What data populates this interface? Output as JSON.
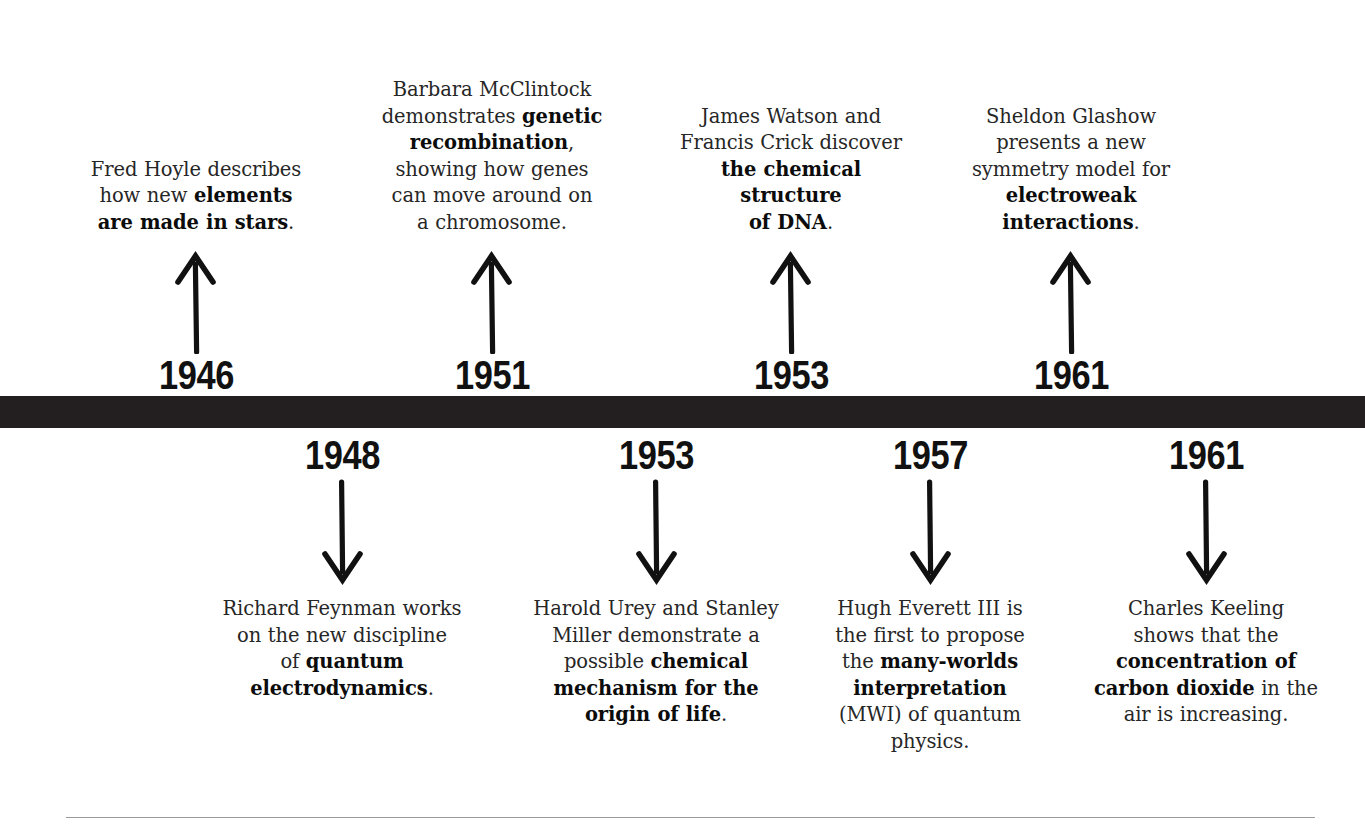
{
  "theme": {
    "background": "#ffffff",
    "bar_color": "#231f20",
    "text_color": "#262626",
    "emphasis_color": "#0c0c0c",
    "rule_color": "#9a9a9a"
  },
  "timeline": {
    "axis_label": "timeline-bar",
    "events_above": [
      {
        "year": "1946",
        "arrow": "arrow-up",
        "caption_html": "Fred Hoyle describes<br>how new <b>elements<br>are made in stars</b>.",
        "caption_text": "Fred Hoyle describes how new elements are made in stars.",
        "emphasis": "elements are made in stars"
      },
      {
        "year": "1951",
        "arrow": "arrow-up",
        "caption_html": "Barbara McClintock<br>demonstrates <b>genetic<br>recombination</b>,<br>showing how genes<br>can move around on<br>a chromosome.",
        "caption_text": "Barbara McClintock demonstrates genetic recombination, showing how genes can move around on a chromosome.",
        "emphasis": "genetic recombination"
      },
      {
        "year": "1953",
        "arrow": "arrow-up",
        "caption_html": "James Watson and<br>Francis Crick discover<br><b>the chemical<br>structure<br>of DNA</b>.",
        "caption_text": "James Watson and Francis Crick discover the chemical structure of DNA.",
        "emphasis": "the chemical structure of DNA"
      },
      {
        "year": "1961",
        "arrow": "arrow-up",
        "caption_html": "Sheldon Glashow<br>presents a new<br>symmetry model for<br><b>electroweak<br>interactions</b>.",
        "caption_text": "Sheldon Glashow presents a new symmetry model for electroweak interactions.",
        "emphasis": "electroweak interactions"
      }
    ],
    "events_below": [
      {
        "year": "1948",
        "arrow": "arrow-down",
        "caption_html": "Richard Feynman works<br>on the new discipline<br>of <b>quantum<br>electrodynamics</b>.",
        "caption_text": "Richard Feynman works on the new discipline of quantum electrodynamics.",
        "emphasis": "quantum electrodynamics"
      },
      {
        "year": "1953",
        "arrow": "arrow-down",
        "caption_html": "Harold Urey and Stanley<br>Miller demonstrate a<br>possible <b>chemical<br>mechanism for the<br>origin of life</b>.",
        "caption_text": "Harold Urey and Stanley Miller demonstrate a possible chemical mechanism for the origin of life.",
        "emphasis": "chemical mechanism for the origin of life"
      },
      {
        "year": "1957",
        "arrow": "arrow-down",
        "caption_html": "Hugh Everett III is<br>the first to propose<br>the <b>many-worlds<br>interpretation</b><br>(MWI) of quantum<br>physics.",
        "caption_text": "Hugh Everett III is the first to propose the many-worlds interpretation (MWI) of quantum physics.",
        "emphasis": "many-worlds interpretation"
      },
      {
        "year": "1961",
        "arrow": "arrow-down",
        "caption_html": "Charles Keeling<br>shows that the<br><b>concentration of<br>carbon dioxide</b> in the<br>air is increasing.",
        "caption_text": "Charles Keeling shows that the concentration of carbon dioxide in the air is increasing.",
        "emphasis": "concentration of carbon dioxide"
      }
    ]
  }
}
